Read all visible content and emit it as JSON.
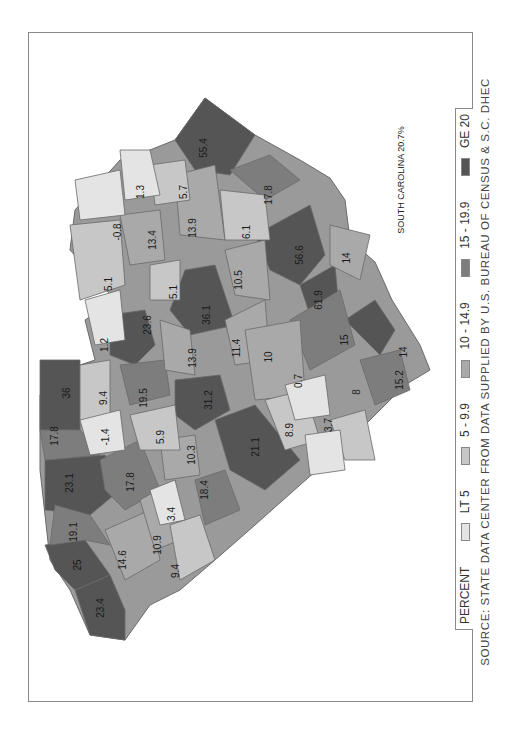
{
  "map": {
    "title": "SOUTH CAROLINA 20.7%",
    "state_total_label": "SOUTH CAROLINA",
    "state_total_value": "20.7%",
    "orientation": "rotated 90 degrees counter-clockwise",
    "county_values": [
      "23.4",
      "25",
      "19.1",
      "14.6",
      "10.9",
      "9.4",
      "3.4",
      "18.4",
      "23.1",
      "17.8",
      "10.3",
      "17.8",
      "-1.4",
      "5.9",
      "21.1",
      "36",
      "9.4",
      "19.5",
      "31.2",
      "8.9",
      "3.7",
      "1.2",
      "23.6",
      "13.9",
      "11.4",
      "10",
      "0.7",
      "8",
      "15.2",
      "5.1",
      "5.1",
      "36.1",
      "10.5",
      "15",
      "61.9",
      "1.3",
      "-0.8",
      "13.4",
      "13.9",
      "6.1",
      "56.6",
      "14",
      "5.7",
      "55.4",
      "17.8",
      "14"
    ]
  },
  "legend": {
    "title": "PERCENT",
    "items": [
      {
        "label": "LT 5",
        "color": "#e4e4e4"
      },
      {
        "label": "5 - 9.9",
        "color": "#c7c7c7"
      },
      {
        "label": "10 - 14.9",
        "color": "#a9a9a9"
      },
      {
        "label": "15 - 19.9",
        "color": "#7d7d7d"
      },
      {
        "label": "GE 20",
        "color": "#555555"
      }
    ]
  },
  "source": "SOURCE: STATE DATA CENTER FROM DATA SUPPLIED BY U.S. BUREAU OF CENSUS & S.C. DHEC"
}
